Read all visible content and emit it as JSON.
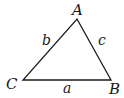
{
  "diagram": {
    "type": "triangle",
    "stroke_color": "#1a1a1a",
    "vertices": [
      {
        "label": "A",
        "x": 77,
        "y": 19
      },
      {
        "label": "B",
        "x": 111,
        "y": 80
      },
      {
        "label": "C",
        "x": 23,
        "y": 80
      }
    ],
    "sides": [
      {
        "label": "a",
        "between": "B-C"
      },
      {
        "label": "b",
        "between": "A-C"
      },
      {
        "label": "c",
        "between": "A-B"
      }
    ]
  }
}
